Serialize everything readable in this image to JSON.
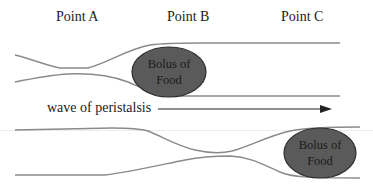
{
  "points": [
    {
      "label": "Point A"
    },
    {
      "label": "Point B"
    },
    {
      "label": "Point C"
    }
  ],
  "top_panel": {
    "bolus": {
      "line1": "Bolus of",
      "line2": "Food"
    }
  },
  "wave": {
    "label": "wave of peristalsis"
  },
  "bottom_panel": {
    "bolus": {
      "line1": "Bolus of",
      "line2": "Food"
    }
  },
  "colors": {
    "tube_line": "#8a8a8a",
    "bolus_fill": "#5a5a5a",
    "bolus_stroke": "#2e2e2e",
    "arrow": "#222222"
  }
}
